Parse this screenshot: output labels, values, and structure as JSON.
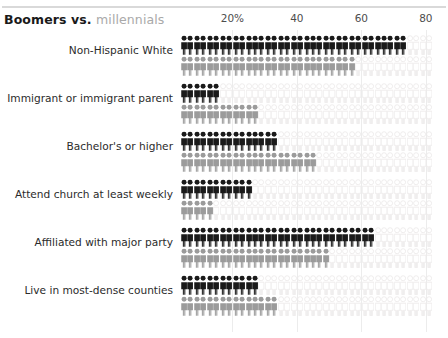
{
  "title": {
    "part1": "Boomers",
    "part2": " vs. ",
    "part3": "millennials"
  },
  "colors": {
    "boomers": "#1a1a1a",
    "millennials": "#9b9b9b",
    "empty": "#eceaea",
    "gridline": "#ececec",
    "rule": "#d9d9d9",
    "label": "#2b2b2b",
    "axis_label": "#4d4d4d"
  },
  "chart_data": {
    "type": "bar",
    "subtype": "pictogram-isotype",
    "title": "Boomers vs. millennials",
    "xlabel": "",
    "ylabel": "",
    "xlim": [
      0,
      82
    ],
    "unit": "percent",
    "units_per_figure": 2,
    "grid": true,
    "legend_position": "title",
    "xticks": [
      20,
      40,
      60,
      80
    ],
    "xticklabels": [
      "20%",
      "40",
      "60",
      "80"
    ],
    "categories": [
      "Non-Hispanic White",
      "Immigrant or immigrant parent",
      "Bachelor's or higher",
      "Attend church at least weekly",
      "Affiliated with major party",
      "Live in most-dense counties"
    ],
    "series": [
      {
        "name": "Boomers",
        "values": [
          72,
          14,
          33,
          24,
          63,
          26
        ]
      },
      {
        "name": "millennials",
        "values": [
          56,
          27,
          44,
          12,
          49,
          33
        ]
      }
    ]
  }
}
